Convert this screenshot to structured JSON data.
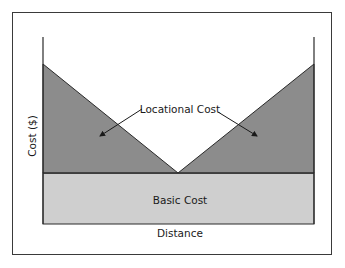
{
  "diagram": {
    "labels": {
      "y_axis": "Cost ($)",
      "x_axis": "Distance",
      "locational": "Locational Cost",
      "basic": "Basic Cost"
    },
    "colors": {
      "locational_fill": "#8c8c8c",
      "basic_fill": "#cfcfcf",
      "line": "#2a2a2a",
      "frame": "#3a3a3a"
    }
  }
}
